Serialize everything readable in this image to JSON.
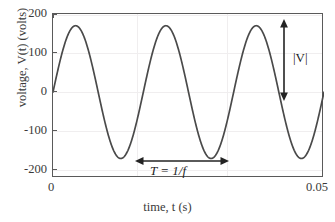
{
  "chart_data": {
    "type": "line",
    "title": "",
    "xlabel": "time, t (s)",
    "ylabel": "voltage, V(t) (volts)",
    "xlim": [
      0,
      0.05
    ],
    "ylim": [
      -220,
      200
    ],
    "grid": true,
    "legend": "none",
    "x_ticks": [
      {
        "value": 0,
        "label": "0"
      },
      {
        "value": 0.05,
        "label": "0.05"
      }
    ],
    "y_ticks": [
      {
        "value": 200,
        "label": "200"
      },
      {
        "value": 100,
        "label": "100"
      },
      {
        "value": 0,
        "label": "0"
      },
      {
        "value": -100,
        "label": "-100"
      },
      {
        "value": -200,
        "label": "-200"
      }
    ],
    "gridlines_vertical": [
      0.01667,
      0.03333
    ],
    "series": [
      {
        "name": "V(t)",
        "color": "#4a4a4a",
        "amplitude": 170,
        "frequency_hz": 60,
        "phase": 0,
        "equation": "V(t) = 170 sin(2 pi 60 t)",
        "cycles_shown": 3,
        "x": [
          0,
          0.00208,
          0.00417,
          0.00625,
          0.00833,
          0.01042,
          0.0125,
          0.01458,
          0.01667,
          0.01875,
          0.02083,
          0.02292,
          0.025,
          0.02708,
          0.02917,
          0.03125,
          0.03333,
          0.03542,
          0.0375,
          0.03958,
          0.04167,
          0.04375,
          0.04583,
          0.04792,
          0.05
        ],
        "values": [
          0,
          120,
          170,
          120,
          0,
          -120,
          -170,
          -120,
          0,
          120,
          170,
          120,
          0,
          -120,
          -170,
          -120,
          0,
          120,
          170,
          120,
          0,
          -120,
          -170,
          -120,
          0
        ]
      }
    ],
    "annotations": [
      {
        "id": "period-annotation",
        "text": "T = 1/f",
        "arrow": "double-headed-horizontal",
        "x_start": 0.01667,
        "x_end": 0.03333,
        "y": -200
      },
      {
        "id": "amplitude-annotation",
        "text": "|V|",
        "arrow": "double-headed-vertical",
        "y_start": 175,
        "y_end": 0,
        "x": 0.0425
      }
    ]
  },
  "colors": {
    "curve": "#4a4a4a",
    "axis": "#5a5a5a",
    "grid": "#f0eeef",
    "text": "#3a3a3a",
    "annotation": "#232323",
    "background": "#ffffff"
  }
}
